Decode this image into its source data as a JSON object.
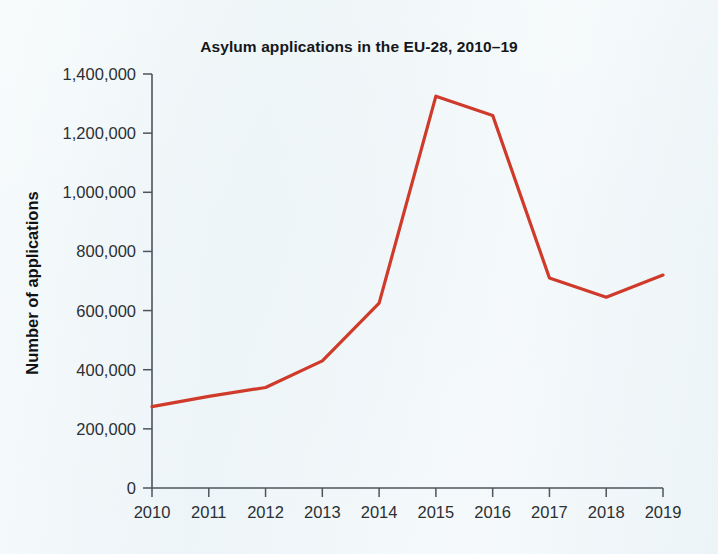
{
  "figure": {
    "title": "Asylum applications in the EU-28, 2010–19",
    "background_color": "#eef5f8",
    "line_color": "#cf3a2b",
    "axis_color": "#4c565c",
    "text_color": "#15171a"
  },
  "chart_data": {
    "type": "line",
    "title": "Asylum applications in the EU-28, 2010–19",
    "xlabel": "",
    "ylabel": "Number of applications",
    "categories": [
      "2010",
      "2011",
      "2012",
      "2013",
      "2014",
      "2015",
      "2016",
      "2017",
      "2018",
      "2019"
    ],
    "x": [
      2010,
      2011,
      2012,
      2013,
      2014,
      2015,
      2016,
      2017,
      2018,
      2019
    ],
    "values": [
      275000,
      310000,
      340000,
      430000,
      625000,
      1325000,
      1260000,
      710000,
      645000,
      720000
    ],
    "series": [
      {
        "name": "Asylum applications",
        "color": "#cf3a2b",
        "values": [
          275000,
          310000,
          340000,
          430000,
          625000,
          1325000,
          1260000,
          710000,
          645000,
          720000
        ]
      }
    ],
    "ylim": [
      0,
      1400000
    ],
    "xlim": [
      2010,
      2019
    ],
    "ytick_values": [
      0,
      200000,
      400000,
      600000,
      800000,
      1000000,
      1200000,
      1400000
    ],
    "ytick_labels": [
      "0",
      "200,000",
      "400,000",
      "600,000",
      "800,000",
      "1,000,000",
      "1,200,000",
      "1,400,000"
    ],
    "xtick_labels": [
      "2010",
      "2011",
      "2012",
      "2013",
      "2014",
      "2015",
      "2016",
      "2017",
      "2018",
      "2019"
    ],
    "grid": false,
    "legend": false,
    "legend_position": "none"
  }
}
